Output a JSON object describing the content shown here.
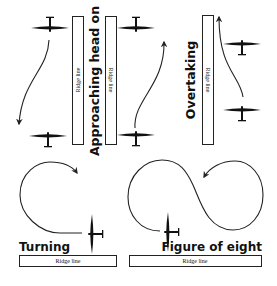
{
  "diagram": {
    "sections": [
      {
        "id": "approaching",
        "title": "Approaching head on",
        "ridge_labels": [
          "Ridge line",
          "Ridge line"
        ]
      },
      {
        "id": "overtaking",
        "title": "Overtaking",
        "ridge_labels": [
          "Ridge line"
        ]
      },
      {
        "id": "turning",
        "title": "Turning",
        "ridge_labels": [
          "Ridge line"
        ]
      },
      {
        "id": "figure-eight",
        "title": "Figure of eight",
        "ridge_labels": [
          "Ridge line"
        ]
      }
    ],
    "colors": {
      "ink": "#111111",
      "background": "#ffffff"
    }
  }
}
